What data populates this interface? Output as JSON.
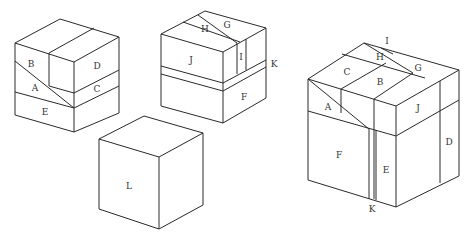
{
  "diagram": {
    "cubes": [
      {
        "id": "cube-1",
        "labels": {
          "A": "A",
          "B": "B",
          "C": "C",
          "D": "D",
          "E": "E"
        }
      },
      {
        "id": "cube-2",
        "labels": {
          "F": "F",
          "G": "G",
          "H": "H",
          "I": "I",
          "J": "J",
          "K": "K"
        }
      },
      {
        "id": "cube-3-empty",
        "labels": {
          "L": "L"
        }
      },
      {
        "id": "cube-4-assembled",
        "labels": {
          "A": "A",
          "B": "B",
          "C": "C",
          "D": "D",
          "E": "E",
          "F": "F",
          "G": "G",
          "H": "H",
          "I": "I",
          "J": "J",
          "K": "K"
        }
      }
    ]
  }
}
